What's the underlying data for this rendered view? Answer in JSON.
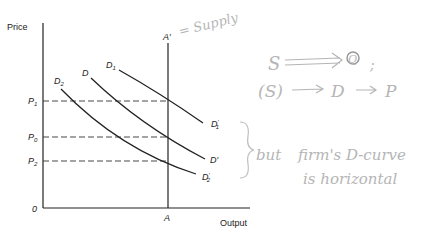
{
  "diagram": {
    "type": "economics supply-demand diagram",
    "axes": {
      "y_label": "Price",
      "x_label": "Output",
      "origin_label": "0"
    },
    "supply_line": {
      "bottom_label": "A",
      "top_label": "A′"
    },
    "price_levels": [
      {
        "label": "P",
        "sub": "1"
      },
      {
        "label": "P",
        "sub": "0"
      },
      {
        "label": "P",
        "sub": "2"
      }
    ],
    "demand_curves": [
      {
        "start_label": "D",
        "start_sub": "1",
        "end_label": "D",
        "end_sub": "1",
        "end_prime": "′"
      },
      {
        "start_label": "D",
        "start_sub": "",
        "end_label": "D′",
        "end_sub": "",
        "end_prime": ""
      },
      {
        "start_label": "D",
        "start_sub": "2",
        "end_label": "D",
        "end_sub": "2",
        "end_prime": "′"
      }
    ]
  },
  "annotations": {
    "supply_note": "= Supply",
    "line1_a": "S",
    "line1_b": "Q",
    "line1_c": ";",
    "line2_a": "(S)",
    "line2_b": "D",
    "line2_c": "P",
    "brace_note": "but",
    "note_line1": "firm's D-curve",
    "note_line2": "is horizontal"
  }
}
